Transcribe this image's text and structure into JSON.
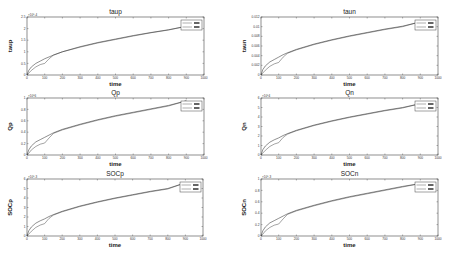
{
  "chart_data": [
    {
      "type": "line",
      "title": "taup",
      "xlabel": "time",
      "ylabel": "taup",
      "y_exponent": "x10^-4",
      "xlim": [
        0,
        1000
      ],
      "ylim": [
        0,
        2.5
      ],
      "xticks": [
        0,
        100,
        200,
        300,
        400,
        500,
        600,
        700,
        800,
        900,
        1000
      ],
      "yticks": [
        "0",
        "0.5",
        "1",
        "1.5",
        "2",
        "2.5"
      ],
      "legend": [
        "series 1",
        "series 2"
      ],
      "legend_position": "upper right",
      "x": [
        0,
        10,
        25,
        50,
        75,
        100,
        125,
        150,
        200,
        300,
        400,
        500,
        600,
        700,
        800,
        900
      ],
      "series": [
        {
          "name": "series 1",
          "values": [
            0,
            0.2,
            0.35,
            0.5,
            0.6,
            0.7,
            0.78,
            0.86,
            1.0,
            1.22,
            1.4,
            1.55,
            1.7,
            1.83,
            1.95,
            2.1
          ]
        },
        {
          "name": "series 2",
          "values": [
            0,
            0.08,
            0.2,
            0.35,
            0.45,
            0.5,
            0.7,
            0.86,
            1.0,
            1.2,
            1.38,
            1.53,
            1.68,
            1.82,
            1.94,
            2.1
          ]
        }
      ]
    },
    {
      "type": "line",
      "title": "taun",
      "xlabel": "time",
      "ylabel": "taun",
      "xlim": [
        0,
        1000
      ],
      "ylim": [
        0,
        0.012
      ],
      "xticks": [
        0,
        100,
        200,
        300,
        400,
        500,
        600,
        700,
        800,
        900,
        1000
      ],
      "yticks": [
        "0",
        "0.002",
        "0.004",
        "0.006",
        "0.008",
        "0.01",
        "0.012"
      ],
      "legend": [
        "series 1",
        "series 2"
      ],
      "legend_position": "upper right",
      "x": [
        0,
        10,
        25,
        50,
        75,
        100,
        125,
        150,
        200,
        300,
        400,
        500,
        600,
        700,
        800,
        900
      ],
      "series": [
        {
          "name": "series 1",
          "values": [
            0,
            0.0011,
            0.0019,
            0.0027,
            0.0032,
            0.0037,
            0.0042,
            0.0046,
            0.0053,
            0.0064,
            0.0073,
            0.0081,
            0.0088,
            0.0095,
            0.0101,
            0.011
          ]
        },
        {
          "name": "series 2",
          "values": [
            0,
            0.0004,
            0.001,
            0.0018,
            0.0023,
            0.0026,
            0.0037,
            0.0045,
            0.0052,
            0.0063,
            0.0072,
            0.008,
            0.0087,
            0.0094,
            0.01,
            0.011
          ]
        }
      ]
    },
    {
      "type": "line",
      "title": "Qp",
      "xlabel": "time",
      "ylabel": "Qp",
      "y_exponent": "x10^6",
      "xlim": [
        0,
        1000
      ],
      "ylim": [
        0,
        1
      ],
      "xticks": [
        0,
        100,
        200,
        300,
        400,
        500,
        600,
        700,
        800,
        900,
        1000
      ],
      "yticks": [
        "0",
        "0.2",
        "0.4",
        "0.6",
        "0.8",
        "1"
      ],
      "legend": [
        "series 1",
        "series 2"
      ],
      "legend_position": "upper right",
      "x": [
        0,
        10,
        25,
        50,
        75,
        100,
        125,
        150,
        200,
        300,
        400,
        500,
        600,
        700,
        800,
        900
      ],
      "series": [
        {
          "name": "series 1",
          "values": [
            0,
            0.09,
            0.16,
            0.23,
            0.27,
            0.31,
            0.35,
            0.39,
            0.45,
            0.54,
            0.62,
            0.69,
            0.75,
            0.81,
            0.87,
            0.95
          ]
        },
        {
          "name": "series 2",
          "values": [
            0,
            0.03,
            0.09,
            0.15,
            0.19,
            0.21,
            0.3,
            0.38,
            0.44,
            0.53,
            0.61,
            0.68,
            0.74,
            0.8,
            0.86,
            0.95
          ]
        }
      ]
    },
    {
      "type": "line",
      "title": "Qn",
      "xlabel": "time",
      "ylabel": "Qn",
      "y_exponent": "x10^4",
      "xlim": [
        0,
        1000
      ],
      "ylim": [
        0,
        6
      ],
      "xticks": [
        0,
        100,
        200,
        300,
        400,
        500,
        600,
        700,
        800,
        900,
        1000
      ],
      "yticks": [
        "0",
        "1",
        "2",
        "3",
        "4",
        "5",
        "6"
      ],
      "legend": [
        "series 1",
        "series 2"
      ],
      "legend_position": "upper right",
      "x": [
        0,
        10,
        25,
        50,
        75,
        100,
        125,
        150,
        200,
        300,
        400,
        500,
        600,
        700,
        800,
        900
      ],
      "series": [
        {
          "name": "series 1",
          "values": [
            0,
            0.55,
            0.95,
            1.35,
            1.6,
            1.8,
            2.05,
            2.25,
            2.6,
            3.15,
            3.6,
            4.0,
            4.35,
            4.7,
            5.0,
            5.4
          ]
        },
        {
          "name": "series 2",
          "values": [
            0,
            0.2,
            0.5,
            0.9,
            1.15,
            1.3,
            1.85,
            2.2,
            2.55,
            3.1,
            3.55,
            3.95,
            4.3,
            4.65,
            4.95,
            5.4
          ]
        }
      ]
    },
    {
      "type": "line",
      "title": "SOCp",
      "xlabel": "time",
      "ylabel": "SOCp",
      "y_exponent": "x10^-3",
      "xlim": [
        0,
        1000
      ],
      "ylim": [
        0,
        6
      ],
      "xticks": [
        0,
        100,
        200,
        300,
        400,
        500,
        600,
        700,
        800,
        900,
        1000
      ],
      "yticks": [
        "0",
        "1",
        "2",
        "3",
        "4",
        "5",
        "6"
      ],
      "legend": [
        "series 1",
        "series 2"
      ],
      "legend_position": "upper right",
      "x": [
        0,
        10,
        25,
        50,
        75,
        100,
        125,
        150,
        200,
        300,
        400,
        500,
        600,
        700,
        800,
        900
      ],
      "series": [
        {
          "name": "series 1",
          "values": [
            0,
            0.55,
            0.95,
            1.35,
            1.6,
            1.8,
            2.05,
            2.25,
            2.6,
            3.15,
            3.6,
            4.0,
            4.35,
            4.7,
            5.0,
            5.6
          ]
        },
        {
          "name": "series 2",
          "values": [
            0,
            0.2,
            0.5,
            0.9,
            1.15,
            1.3,
            1.85,
            2.2,
            2.55,
            3.1,
            3.55,
            3.95,
            4.3,
            4.65,
            4.95,
            5.6
          ]
        }
      ]
    },
    {
      "type": "line",
      "title": "SOCn",
      "xlabel": "time",
      "ylabel": "SOCn",
      "y_exponent": "x10^-3",
      "xlim": [
        0,
        1000
      ],
      "ylim": [
        0,
        1
      ],
      "xticks": [
        0,
        100,
        200,
        300,
        400,
        500,
        600,
        700,
        800,
        900,
        1000
      ],
      "yticks": [
        "0",
        "0.2",
        "0.4",
        "0.6",
        "0.8",
        "1"
      ],
      "legend": [
        "series 1",
        "series 2"
      ],
      "legend_position": "upper right",
      "x": [
        0,
        10,
        25,
        50,
        75,
        100,
        125,
        150,
        200,
        300,
        400,
        500,
        600,
        700,
        800,
        900
      ],
      "series": [
        {
          "name": "series 1",
          "values": [
            0,
            0.09,
            0.16,
            0.23,
            0.27,
            0.31,
            0.35,
            0.39,
            0.45,
            0.54,
            0.62,
            0.69,
            0.75,
            0.81,
            0.87,
            0.92
          ]
        },
        {
          "name": "series 2",
          "values": [
            0,
            0.03,
            0.09,
            0.15,
            0.19,
            0.21,
            0.3,
            0.38,
            0.44,
            0.53,
            0.61,
            0.68,
            0.74,
            0.8,
            0.86,
            0.92
          ]
        }
      ]
    }
  ],
  "layout": {
    "panels": [
      {
        "left": 27,
        "top": 17,
        "width": 177,
        "height": 58
      },
      {
        "left": 261,
        "top": 17,
        "width": 177,
        "height": 58
      },
      {
        "left": 27,
        "top": 98,
        "width": 177,
        "height": 57
      },
      {
        "left": 261,
        "top": 98,
        "width": 177,
        "height": 57
      },
      {
        "left": 27,
        "top": 179,
        "width": 176,
        "height": 57
      },
      {
        "left": 261,
        "top": 179,
        "width": 177,
        "height": 57
      }
    ],
    "line_color": "#333333",
    "axis_color": "#444444"
  }
}
